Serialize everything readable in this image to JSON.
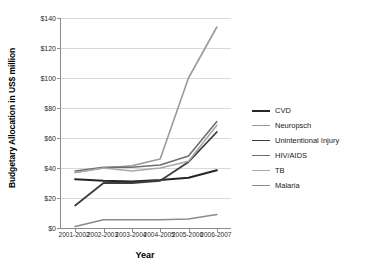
{
  "chart_data": {
    "type": "line",
    "title": "",
    "xlabel": "Year",
    "ylabel": "Budgetary Allocation in US$ million",
    "categories": [
      "2001-2002",
      "2002-2003",
      "2003-2004",
      "2004-2005",
      "2005-2006",
      "2006-2007"
    ],
    "ylim": [
      0,
      140
    ],
    "yticks": [
      "$0",
      "$20",
      "$40",
      "$60",
      "$80",
      "$100",
      "$120",
      "$140"
    ],
    "ytick_values": [
      0,
      20,
      40,
      60,
      80,
      100,
      120,
      140
    ],
    "grid": true,
    "legend_position": "right",
    "series": [
      {
        "name": "CVD",
        "color": "#262626",
        "width": 2.1,
        "values": [
          32.5,
          31.5,
          31.0,
          32.0,
          33.5,
          38.5
        ]
      },
      {
        "name": "Neuropsch",
        "color": "#9a9a9a",
        "width": 1.6,
        "values": [
          37.0,
          40.0,
          41.5,
          46.0,
          100.0,
          134.0
        ]
      },
      {
        "name": "Unintentional Injury",
        "color": "#3d3d3d",
        "width": 1.8,
        "values": [
          15.0,
          30.0,
          30.0,
          31.5,
          44.0,
          64.0
        ]
      },
      {
        "name": "HIV/AIDS",
        "color": "#6e6e6e",
        "width": 1.6,
        "values": [
          38.0,
          40.5,
          40.5,
          42.0,
          48.0,
          71.0
        ]
      },
      {
        "name": "TB",
        "color": "#a8a8a8",
        "width": 1.6,
        "values": [
          37.0,
          40.0,
          38.0,
          40.0,
          44.5,
          68.5
        ]
      },
      {
        "name": "Malaria",
        "color": "#8a8a8a",
        "width": 1.6,
        "values": [
          1.0,
          5.5,
          5.5,
          5.5,
          6.0,
          9.0
        ]
      }
    ]
  }
}
